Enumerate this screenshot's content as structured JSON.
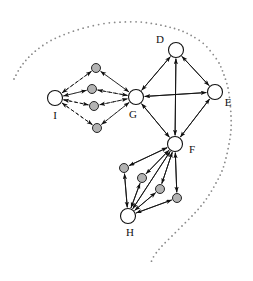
{
  "figure": {
    "type": "directed-graph-diagram",
    "width": 253,
    "height": 281,
    "background": "#ffffff",
    "boundary": {
      "name": "dotted-region-boundary",
      "style": "dotted",
      "color": "#888888",
      "dot_radius": 0.9,
      "description": "open dotted curve enclosing the whole graph, starting at lower-left-of-top-arc and ending at bottom-center-right"
    }
  },
  "colors": {
    "major_node_fill": "#ffffff",
    "major_node_stroke": "#111111",
    "minor_node_fill": "#b3b3b3",
    "minor_node_stroke": "#111111",
    "edge_solid": "#111111",
    "edge_dashed": "#111111",
    "label": "#111111",
    "boundary": "#8a8a8a"
  },
  "nodes": {
    "major": [
      {
        "id": "D",
        "label": "D",
        "cx": 176,
        "cy": 50,
        "r": 7.5,
        "label_x": 160,
        "label_y": 43
      },
      {
        "id": "E",
        "label": "E",
        "cx": 215,
        "cy": 92,
        "r": 7.5,
        "label_x": 228,
        "label_y": 106
      },
      {
        "id": "F",
        "label": "F",
        "cx": 175,
        "cy": 144,
        "r": 7.5,
        "label_x": 192,
        "label_y": 153
      },
      {
        "id": "G",
        "label": "G",
        "cx": 136,
        "cy": 97,
        "r": 7.5,
        "label_x": 133,
        "label_y": 118
      },
      {
        "id": "H",
        "label": "H",
        "cx": 128,
        "cy": 216,
        "r": 7.5,
        "label_x": 130,
        "label_y": 236
      },
      {
        "id": "I",
        "label": "I",
        "cx": 55,
        "cy": 98,
        "r": 7.5,
        "label_x": 55,
        "label_y": 119
      }
    ],
    "minor_left_cluster": [
      {
        "id": "i1",
        "cx": 96,
        "cy": 68,
        "r": 4.5
      },
      {
        "id": "i2",
        "cx": 92,
        "cy": 89,
        "r": 4.5
      },
      {
        "id": "i3",
        "cx": 94,
        "cy": 106,
        "r": 4.5
      },
      {
        "id": "i4",
        "cx": 97,
        "cy": 128,
        "r": 4.5
      }
    ],
    "minor_bottom_cluster": [
      {
        "id": "h1",
        "cx": 124,
        "cy": 168,
        "r": 4.5
      },
      {
        "id": "h2",
        "cx": 142,
        "cy": 178,
        "r": 4.5
      },
      {
        "id": "h3",
        "cx": 160,
        "cy": 189,
        "r": 4.5
      },
      {
        "id": "h4",
        "cx": 177,
        "cy": 198,
        "r": 4.5
      }
    ]
  },
  "edges": {
    "solid_major": [
      {
        "from": "G",
        "to": "D",
        "bidirectional": true
      },
      {
        "from": "D",
        "to": "E",
        "bidirectional": true
      },
      {
        "from": "G",
        "to": "E",
        "bidirectional": true
      },
      {
        "from": "G",
        "to": "F",
        "bidirectional": true
      },
      {
        "from": "D",
        "to": "F",
        "bidirectional": true
      },
      {
        "from": "E",
        "to": "F",
        "bidirectional": true
      }
    ],
    "solid_bottom_cluster": [
      {
        "from": "F",
        "to": "h1",
        "bidirectional": true
      },
      {
        "from": "F",
        "to": "h2",
        "bidirectional": true
      },
      {
        "from": "F",
        "to": "h3",
        "bidirectional": true
      },
      {
        "from": "F",
        "to": "h4",
        "bidirectional": true
      },
      {
        "from": "F",
        "to": "H",
        "bidirectional": true
      },
      {
        "from": "h1",
        "to": "H",
        "bidirectional": true
      },
      {
        "from": "h2",
        "to": "H",
        "bidirectional": true
      },
      {
        "from": "h3",
        "to": "H",
        "bidirectional": true
      },
      {
        "from": "h4",
        "to": "H",
        "bidirectional": true
      }
    ],
    "dashed_left_cluster": [
      {
        "from": "I",
        "to": "i1",
        "bidirectional": true
      },
      {
        "from": "I",
        "to": "i2",
        "bidirectional": true
      },
      {
        "from": "I",
        "to": "i3",
        "bidirectional": true
      },
      {
        "from": "I",
        "to": "i4",
        "bidirectional": true
      },
      {
        "from": "i1",
        "to": "G",
        "bidirectional": true
      },
      {
        "from": "i2",
        "to": "G",
        "bidirectional": true
      },
      {
        "from": "i3",
        "to": "G",
        "bidirectional": true
      },
      {
        "from": "i4",
        "to": "G",
        "bidirectional": true
      }
    ]
  },
  "labels": {
    "D": "D",
    "E": "E",
    "F": "F",
    "G": "G",
    "H": "H",
    "I": "I"
  }
}
